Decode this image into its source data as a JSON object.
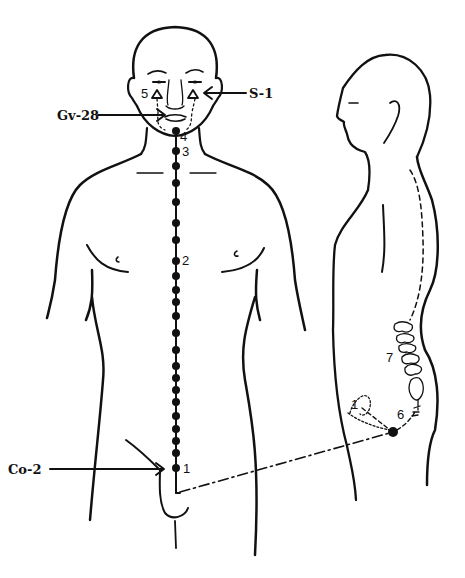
{
  "figure": {
    "type": "anatomical meridian diagram",
    "views": [
      "front-view",
      "side-view"
    ],
    "labels": {
      "s1": "S-1",
      "gv28": "Gv-28",
      "co2": "Co-2"
    },
    "point_numbers": {
      "p1_front": "1",
      "p2": "2",
      "p3": "3",
      "p4": "4",
      "p5": "5",
      "p6": "6",
      "p7": "7",
      "p1_side": "1"
    },
    "colors": {
      "ink": "#111111",
      "background": "#ffffff"
    }
  }
}
